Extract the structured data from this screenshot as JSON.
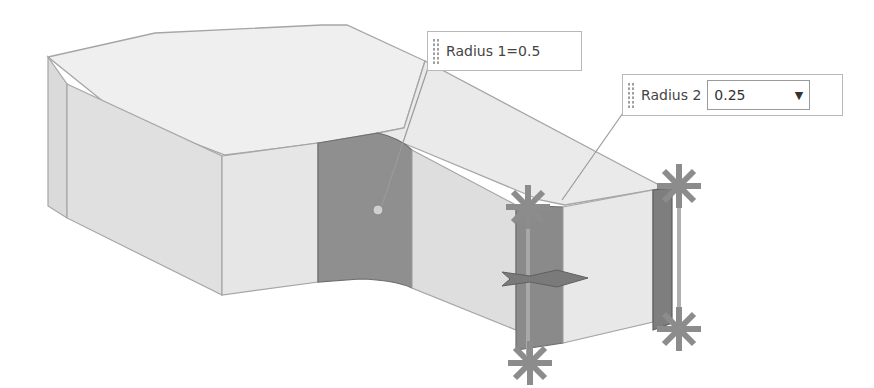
{
  "viewport": {
    "background": "#ffffff",
    "model": {
      "face_colors": {
        "top": "#efefef",
        "side_light": "#e2e2e2",
        "side_mid": "#d6d6d6",
        "fillet_selected": "#8f8f8f",
        "fillet_edge": "#7a7a7a",
        "edge_line": "#a6a6a6"
      },
      "handle_color": "#8c8c8c"
    }
  },
  "annotations": {
    "radius1": {
      "label": "Radius 1=0.5",
      "grip_icon": "drag-grip"
    },
    "radius2": {
      "label": "Radius 2",
      "value": "0.25",
      "dropdown_icon": "▼",
      "grip_icon": "drag-grip"
    }
  },
  "handles": [
    {
      "name": "radius2-handle-top-left",
      "x": 528,
      "y": 207
    },
    {
      "name": "radius2-handle-bottom-left",
      "x": 530,
      "y": 363
    },
    {
      "name": "radius2-handle-top-right",
      "x": 679,
      "y": 186
    },
    {
      "name": "radius2-handle-bottom-right",
      "x": 679,
      "y": 329
    }
  ]
}
